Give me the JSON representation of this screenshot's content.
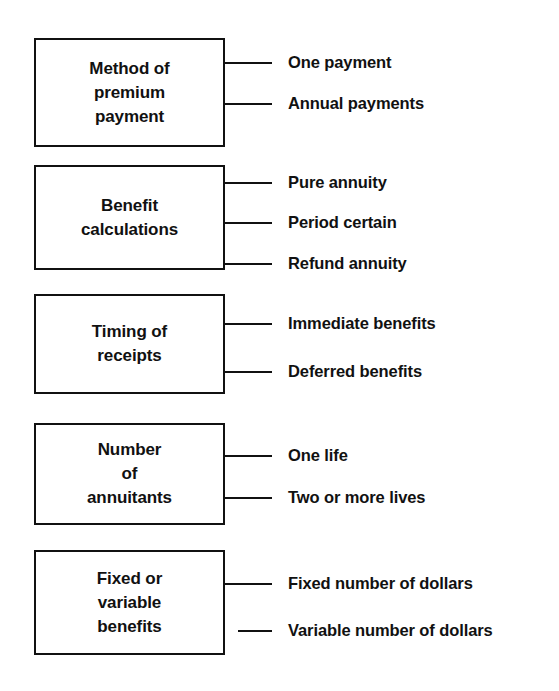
{
  "diagram": {
    "background_color": "#ffffff",
    "line_color": "#111111",
    "text_color": "#111111",
    "groups": [
      {
        "id": "method-of-premium-payment",
        "box_label": "Method of\npremium\npayment",
        "box": {
          "x": 34,
          "y": 38,
          "width": 191,
          "height": 109
        },
        "branches": [
          {
            "id": "one-payment",
            "label": "One payment",
            "y": 62
          },
          {
            "id": "annual-payments",
            "label": "Annual payments",
            "y": 103
          }
        ]
      },
      {
        "id": "benefit-calculations",
        "box_label": "Benefit\ncalculations",
        "box": {
          "x": 34,
          "y": 165,
          "width": 191,
          "height": 105
        },
        "branches": [
          {
            "id": "pure-annuity",
            "label": "Pure annuity",
            "y": 182
          },
          {
            "id": "period-certain",
            "label": "Period certain",
            "y": 222
          },
          {
            "id": "refund-annuity",
            "label": "Refund annuity",
            "y": 263
          }
        ]
      },
      {
        "id": "timing-of-receipts",
        "box_label": "Timing of\nreceipts",
        "box": {
          "x": 34,
          "y": 294,
          "width": 191,
          "height": 100
        },
        "branches": [
          {
            "id": "immediate-benefits",
            "label": "Immediate benefits",
            "y": 323
          },
          {
            "id": "deferred-benefits",
            "label": "Deferred benefits",
            "y": 371
          }
        ]
      },
      {
        "id": "number-of-annuitants",
        "box_label": "Number\nof\nannuitants",
        "box": {
          "x": 34,
          "y": 423,
          "width": 191,
          "height": 102
        },
        "branches": [
          {
            "id": "one-life",
            "label": "One life",
            "y": 455
          },
          {
            "id": "two-or-more-lives",
            "label": "Two or more lives",
            "y": 497
          }
        ]
      },
      {
        "id": "fixed-or-variable-benefits",
        "box_label": "Fixed or\nvariable\nbenefits",
        "box": {
          "x": 34,
          "y": 550,
          "width": 191,
          "height": 105
        },
        "branches": [
          {
            "id": "fixed-number-of-dollars",
            "label": "Fixed number of dollars",
            "y": 583
          },
          {
            "id": "variable-number-of-dollars",
            "label": "Variable number of dollars",
            "y": 630,
            "detached": true
          }
        ]
      }
    ],
    "layout": {
      "connector_start_x": 225,
      "connector_end_x": 272,
      "detached_connector_start_x": 238,
      "label_x": 288
    }
  }
}
